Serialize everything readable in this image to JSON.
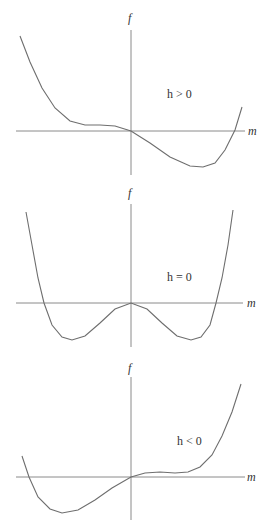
{
  "panels": [
    {
      "condition": "h > 0",
      "y_label": "f",
      "x_label": "m",
      "axis_y_x": 131,
      "axis_y_top": 30,
      "axis_y_bottom": 175,
      "axis_x_y": 131,
      "axis_x_left": 16,
      "axis_x_right": 245,
      "f_label_pos": [
        128,
        22
      ],
      "m_label_pos": [
        248,
        135
      ],
      "cond_pos": [
        167,
        98
      ],
      "curve": [
        [
          20,
          36
        ],
        [
          30,
          62
        ],
        [
          42,
          88
        ],
        [
          55,
          108
        ],
        [
          70,
          121
        ],
        [
          85,
          125
        ],
        [
          100,
          125
        ],
        [
          115,
          126
        ],
        [
          131,
          131
        ],
        [
          150,
          143
        ],
        [
          170,
          157
        ],
        [
          190,
          166
        ],
        [
          203,
          167
        ],
        [
          215,
          163
        ],
        [
          225,
          150
        ],
        [
          235,
          130
        ],
        [
          242,
          107
        ]
      ]
    },
    {
      "condition": "h = 0",
      "y_label": "f",
      "x_label": "m",
      "axis_y_x": 131,
      "axis_y_top": 204,
      "axis_y_bottom": 347,
      "axis_x_y": 303,
      "axis_x_left": 16,
      "axis_x_right": 243,
      "f_label_pos": [
        128,
        197
      ],
      "m_label_pos": [
        247,
        307
      ],
      "cond_pos": [
        167,
        281
      ],
      "curve": [
        [
          26,
          212
        ],
        [
          32,
          245
        ],
        [
          38,
          278
        ],
        [
          44,
          303
        ],
        [
          52,
          325
        ],
        [
          62,
          337
        ],
        [
          72,
          340
        ],
        [
          85,
          336
        ],
        [
          100,
          323
        ],
        [
          115,
          309
        ],
        [
          131,
          303
        ],
        [
          147,
          309
        ],
        [
          162,
          323
        ],
        [
          177,
          336
        ],
        [
          191,
          340
        ],
        [
          201,
          337
        ],
        [
          210,
          325
        ],
        [
          216,
          303
        ],
        [
          222,
          278
        ],
        [
          228,
          245
        ],
        [
          233,
          210
        ]
      ]
    },
    {
      "condition": "h < 0",
      "y_label": "f",
      "x_label": "m",
      "axis_y_x": 131,
      "axis_y_top": 377,
      "axis_y_bottom": 520,
      "axis_x_y": 477,
      "axis_x_left": 16,
      "axis_x_right": 245,
      "f_label_pos": [
        128,
        372
      ],
      "m_label_pos": [
        247,
        481
      ],
      "cond_pos": [
        177,
        445
      ],
      "curve": [
        [
          22,
          456
        ],
        [
          29,
          477
        ],
        [
          38,
          497
        ],
        [
          50,
          509
        ],
        [
          62,
          513
        ],
        [
          78,
          510
        ],
        [
          95,
          500
        ],
        [
          112,
          488
        ],
        [
          131,
          477
        ],
        [
          145,
          473
        ],
        [
          160,
          472
        ],
        [
          175,
          473
        ],
        [
          188,
          472
        ],
        [
          200,
          467
        ],
        [
          212,
          455
        ],
        [
          222,
          436
        ],
        [
          232,
          412
        ],
        [
          241,
          384
        ]
      ]
    }
  ]
}
